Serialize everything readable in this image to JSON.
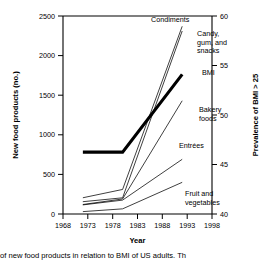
{
  "chart_data": {
    "type": "line",
    "title": "",
    "xlabel": "Year",
    "ylabel": "New food products (no.)",
    "y2label": "Prevalence of BMI > 25",
    "xlim": [
      1968,
      1998
    ],
    "ylim": [
      0,
      2500
    ],
    "y2lim": [
      40,
      60
    ],
    "xticks": [
      1968,
      1973,
      1978,
      1983,
      1988,
      1993,
      1998
    ],
    "yticks": [
      0,
      500,
      1000,
      1500,
      2000,
      2500
    ],
    "y2ticks": [
      40,
      45,
      50,
      55,
      60
    ],
    "grid": false,
    "legend_position": "inline-annotations",
    "series": [
      {
        "name": "Condiments",
        "axis": "left",
        "x": [
          1972,
          1980,
          1992
        ],
        "values": [
          205,
          310,
          2370
        ],
        "label_lines": [
          "Condiments"
        ]
      },
      {
        "name": "Candy, gum, and snacks",
        "axis": "left",
        "x": [
          1972,
          1980,
          1992
        ],
        "values": [
          155,
          205,
          2310
        ],
        "label_lines": [
          "Candy,",
          "gum, and",
          "snacks"
        ]
      },
      {
        "name": "BMI",
        "axis": "right",
        "x": [
          1972,
          1980,
          1992
        ],
        "values": [
          46.25,
          46.25,
          54.1
        ],
        "left_equivalent": [
          780,
          780,
          1830
        ],
        "label_lines": [
          "BMI"
        ],
        "emphasis": "thick-black"
      },
      {
        "name": "Bakery foods",
        "axis": "left",
        "x": [
          1972,
          1980,
          1992
        ],
        "values": [
          120,
          190,
          1430
        ],
        "label_lines": [
          "Bakery",
          "foods"
        ]
      },
      {
        "name": "Entrées",
        "axis": "left",
        "x": [
          1972,
          1980,
          1992
        ],
        "values": [
          115,
          175,
          690
        ],
        "label_lines": [
          "Entrées"
        ]
      },
      {
        "name": "Fruit and vegetables",
        "axis": "left",
        "x": [
          1972,
          1980,
          1992
        ],
        "values": [
          30,
          65,
          400
        ],
        "label_lines": [
          "Fruit and",
          "vegetables"
        ]
      }
    ]
  },
  "axes": {
    "left_title": "New food products (no.)",
    "right_title": "Prevalence of BMI > 25",
    "x_title": "Year",
    "xtick_labels": [
      "1968",
      "1973",
      "1978",
      "1983",
      "1988",
      "1993",
      "1998"
    ],
    "ytick_labels": [
      "0",
      "500",
      "1000",
      "1500",
      "2000",
      "2500"
    ],
    "y2tick_labels": [
      "40",
      "45",
      "50",
      "55",
      "60"
    ]
  },
  "annotations": {
    "condiments": "Condiments",
    "candy_1": "Candy,",
    "candy_2": "gum, and",
    "candy_3": "snacks",
    "bmi": "BMI",
    "bakery_1": "Bakery",
    "bakery_2": "foods",
    "entrees": "Entrées",
    "fruit_1": "Fruit and",
    "fruit_2": "vegetables"
  },
  "caption": {
    "text": "of new food products in relation to BMI of US adults. Th"
  },
  "colors": {
    "line": "#000000",
    "bmi_line": "#000000",
    "background": "#ffffff",
    "axis": "#000000"
  }
}
